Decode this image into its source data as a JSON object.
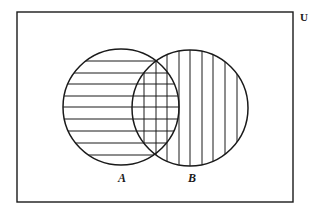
{
  "diagram": {
    "type": "venn",
    "universe_label": "U",
    "sets": [
      {
        "name": "A",
        "label": "A",
        "shading": "horizontal-lines"
      },
      {
        "name": "B",
        "label": "B",
        "shading": "vertical-lines"
      }
    ],
    "shaded_region": "A ∪ B",
    "intersection_shading": "cross-hatch"
  },
  "geometry": {
    "universe_rect": {
      "x": 17,
      "y": 12,
      "w": 276,
      "h": 190
    },
    "circle_a": {
      "cx": 121,
      "cy": 107,
      "r": 58
    },
    "circle_b": {
      "cx": 190,
      "cy": 108,
      "r": 58
    },
    "hatch_horizontal_y": [
      61,
      73,
      84,
      96,
      107,
      119,
      131,
      143,
      155
    ],
    "hatch_vertical_x": [
      144,
      156,
      167,
      179,
      190,
      202,
      213,
      225,
      237
    ],
    "label_a_pos": {
      "x": 122,
      "y": 182
    },
    "label_b_pos": {
      "x": 192,
      "y": 182
    },
    "universe_label_pos": {
      "x": 300,
      "y": 21
    }
  },
  "colors": {
    "stroke": "#1a1a1a",
    "background": "#ffffff"
  }
}
